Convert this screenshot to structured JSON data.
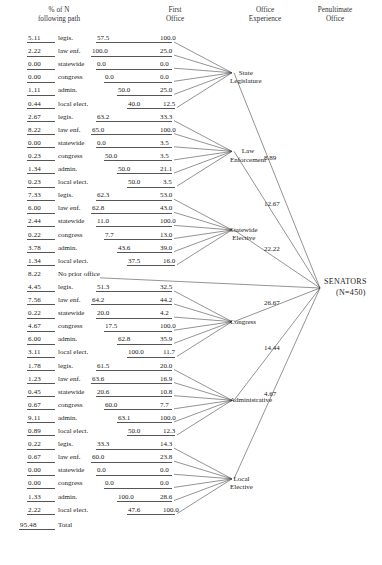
{
  "headers": [
    {
      "line1": "% of N",
      "line2": "following path"
    },
    {
      "line1": "First",
      "line2": "Office"
    },
    {
      "line1": "Office",
      "line2": "Experience"
    },
    {
      "line1": "Penultimate",
      "line2": "Office"
    }
  ],
  "terminal": {
    "name": "SENATORS",
    "n": "(N=450)"
  },
  "groups": [
    {
      "node": {
        "line1": "State",
        "line2": "Legislature"
      },
      "penultimate": "8.89",
      "rows": [
        {
          "pct": "5.11",
          "label": "legis.",
          "first": "57.5",
          "exp": "100.0"
        },
        {
          "pct": "2.22",
          "label": "law enf.",
          "first": "100.0",
          "exp": "25.0"
        },
        {
          "pct": "0.00",
          "label": "statewide",
          "first": "0.0",
          "exp": "0.0"
        },
        {
          "pct": "0.00",
          "label": "congress",
          "first": "0.0",
          "exp": "0.0"
        },
        {
          "pct": "1.11",
          "label": "admin.",
          "first": "50.0",
          "exp": "25.0"
        },
        {
          "pct": "0.44",
          "label": "local elect.",
          "first": "40.0",
          "exp": "12.5"
        }
      ]
    },
    {
      "node": {
        "line1": "Law",
        "line2": "Enforcement"
      },
      "penultimate": "12.67",
      "rows": [
        {
          "pct": "2.67",
          "label": "legis.",
          "first": "63.2",
          "exp": "33.3"
        },
        {
          "pct": "8.22",
          "label": "law enf.",
          "first": "65.0",
          "exp": "100.0"
        },
        {
          "pct": "0.00",
          "label": "statewide",
          "first": "0.0",
          "exp": "3.5"
        },
        {
          "pct": "0.23",
          "label": "congress",
          "first": "50.0",
          "exp": "3.5"
        },
        {
          "pct": "1.34",
          "label": "admin.",
          "first": "50.0",
          "exp": "21.1"
        },
        {
          "pct": "0.23",
          "label": "local elect.",
          "first": "50.0",
          "exp": "3.5"
        }
      ]
    },
    {
      "node": {
        "line1": "Statewide",
        "line2": "Elective"
      },
      "penultimate": "22.22",
      "rows": [
        {
          "pct": "7.33",
          "label": "legis.",
          "first": "62.3",
          "exp": "53.0"
        },
        {
          "pct": "6.00",
          "label": "law enf.",
          "first": "62.8",
          "exp": "43.0"
        },
        {
          "pct": "2.44",
          "label": "statewide",
          "first": "11.0",
          "exp": "100.0"
        },
        {
          "pct": "0.22",
          "label": "congress",
          "first": "7.7",
          "exp": "13.0"
        },
        {
          "pct": "3.78",
          "label": "admin.",
          "first": "43.6",
          "exp": "39.0"
        },
        {
          "pct": "1.34",
          "label": "local elect.",
          "first": "37.5",
          "exp": "16.0"
        }
      ]
    },
    {
      "node": {
        "line1": "Congress",
        "line2": ""
      },
      "penultimate": "26.67",
      "noprior": {
        "pct": "8.22",
        "label": "No prior office"
      },
      "rows": [
        {
          "pct": "4.45",
          "label": "legis.",
          "first": "51.3",
          "exp": "32.5"
        },
        {
          "pct": "7.56",
          "label": "law enf.",
          "first": "64.2",
          "exp": "44.2"
        },
        {
          "pct": "0.22",
          "label": "statewide",
          "first": "20.0",
          "exp": "4.2"
        },
        {
          "pct": "4.67",
          "label": "congress",
          "first": "17.5",
          "exp": "100.0"
        },
        {
          "pct": "6.00",
          "label": "admin.",
          "first": "62.8",
          "exp": "35.9"
        },
        {
          "pct": "3.11",
          "label": "local elect.",
          "first": "100.0",
          "exp": "11.7"
        }
      ]
    },
    {
      "node": {
        "line1": "Administrative",
        "line2": ""
      },
      "penultimate": "14.44",
      "rows": [
        {
          "pct": "1.78",
          "label": "legis.",
          "first": "61.5",
          "exp": "20.0"
        },
        {
          "pct": "1.23",
          "label": "law enf.",
          "first": "63.6",
          "exp": "16.9"
        },
        {
          "pct": "0.45",
          "label": "statewide",
          "first": "20.6",
          "exp": "10.8"
        },
        {
          "pct": "0.67",
          "label": "congress",
          "first": "60.0",
          "exp": "7.7"
        },
        {
          "pct": "9.11",
          "label": "admin.",
          "first": "63.1",
          "exp": "100.0"
        },
        {
          "pct": "0.89",
          "label": "local elect.",
          "first": "50.0",
          "exp": "12.3"
        }
      ]
    },
    {
      "node": {
        "line1": "Local",
        "line2": "Elective"
      },
      "penultimate": "4.67",
      "rows": [
        {
          "pct": "0.22",
          "label": "legis.",
          "first": "33.3",
          "exp": "14.3"
        },
        {
          "pct": "0.67",
          "label": "law enf.",
          "first": "60.0",
          "exp": "23.8"
        },
        {
          "pct": "0.00",
          "label": "statewide",
          "first": "0.0",
          "exp": "0.0"
        },
        {
          "pct": "0.00",
          "label": "congress",
          "first": "0.0",
          "exp": "0.0"
        },
        {
          "pct": "1.33",
          "label": "admin.",
          "first": "100.0",
          "exp": "28.6"
        },
        {
          "pct": "2.22",
          "label": "local elect.",
          "first": "47.6",
          "exp": "100.0"
        }
      ]
    }
  ],
  "total": {
    "pct": "95.48",
    "label": "Total"
  },
  "chart_data": {
    "type": "diagram",
    "columns": [
      "% of N following path",
      "First Office",
      "Office Experience",
      "Penultimate Office"
    ],
    "terminal_node": "SENATORS (N=450)",
    "penultimate_nodes": [
      {
        "name": "State Legislature",
        "value": 8.89
      },
      {
        "name": "Law Enforcement",
        "value": 12.67
      },
      {
        "name": "Statewide Elective",
        "value": 22.22
      },
      {
        "name": "Congress",
        "value": 26.67
      },
      {
        "name": "Administrative",
        "value": 14.44
      },
      {
        "name": "Local Elective",
        "value": 4.67
      }
    ],
    "no_prior_office": 8.22,
    "total": 95.48,
    "paths": [
      {
        "penultimate": "State Legislature",
        "first_office": "legis.",
        "pct_of_n": 5.11,
        "first": 57.5,
        "experience": 100.0
      },
      {
        "penultimate": "State Legislature",
        "first_office": "law enf.",
        "pct_of_n": 2.22,
        "first": 100.0,
        "experience": 25.0
      },
      {
        "penultimate": "State Legislature",
        "first_office": "statewide",
        "pct_of_n": 0.0,
        "first": 0.0,
        "experience": 0.0
      },
      {
        "penultimate": "State Legislature",
        "first_office": "congress",
        "pct_of_n": 0.0,
        "first": 0.0,
        "experience": 0.0
      },
      {
        "penultimate": "State Legislature",
        "first_office": "admin.",
        "pct_of_n": 1.11,
        "first": 50.0,
        "experience": 25.0
      },
      {
        "penultimate": "State Legislature",
        "first_office": "local elect.",
        "pct_of_n": 0.44,
        "first": 40.0,
        "experience": 12.5
      },
      {
        "penultimate": "Law Enforcement",
        "first_office": "legis.",
        "pct_of_n": 2.67,
        "first": 63.2,
        "experience": 33.3
      },
      {
        "penultimate": "Law Enforcement",
        "first_office": "law enf.",
        "pct_of_n": 8.22,
        "first": 65.0,
        "experience": 100.0
      },
      {
        "penultimate": "Law Enforcement",
        "first_office": "statewide",
        "pct_of_n": 0.0,
        "first": 0.0,
        "experience": 3.5
      },
      {
        "penultimate": "Law Enforcement",
        "first_office": "congress",
        "pct_of_n": 0.23,
        "first": 50.0,
        "experience": 3.5
      },
      {
        "penultimate": "Law Enforcement",
        "first_office": "admin.",
        "pct_of_n": 1.34,
        "first": 50.0,
        "experience": 21.1
      },
      {
        "penultimate": "Law Enforcement",
        "first_office": "local elect.",
        "pct_of_n": 0.23,
        "first": 50.0,
        "experience": 3.5
      },
      {
        "penultimate": "Statewide Elective",
        "first_office": "legis.",
        "pct_of_n": 7.33,
        "first": 62.3,
        "experience": 53.0
      },
      {
        "penultimate": "Statewide Elective",
        "first_office": "law enf.",
        "pct_of_n": 6.0,
        "first": 62.8,
        "experience": 43.0
      },
      {
        "penultimate": "Statewide Elective",
        "first_office": "statewide",
        "pct_of_n": 2.44,
        "first": 11.0,
        "experience": 100.0
      },
      {
        "penultimate": "Statewide Elective",
        "first_office": "congress",
        "pct_of_n": 0.22,
        "first": 7.7,
        "experience": 13.0
      },
      {
        "penultimate": "Statewide Elective",
        "first_office": "admin.",
        "pct_of_n": 3.78,
        "first": 43.6,
        "experience": 39.0
      },
      {
        "penultimate": "Statewide Elective",
        "first_office": "local elect.",
        "pct_of_n": 1.34,
        "first": 37.5,
        "experience": 16.0
      },
      {
        "penultimate": "Congress",
        "first_office": "legis.",
        "pct_of_n": 4.45,
        "first": 51.3,
        "experience": 32.5
      },
      {
        "penultimate": "Congress",
        "first_office": "law enf.",
        "pct_of_n": 7.56,
        "first": 64.2,
        "experience": 44.2
      },
      {
        "penultimate": "Congress",
        "first_office": "statewide",
        "pct_of_n": 0.22,
        "first": 20.0,
        "experience": 4.2
      },
      {
        "penultimate": "Congress",
        "first_office": "congress",
        "pct_of_n": 4.67,
        "first": 17.5,
        "experience": 100.0
      },
      {
        "penultimate": "Congress",
        "first_office": "admin.",
        "pct_of_n": 6.0,
        "first": 62.8,
        "experience": 35.9
      },
      {
        "penultimate": "Congress",
        "first_office": "local elect.",
        "pct_of_n": 3.11,
        "first": 100.0,
        "experience": 11.7
      },
      {
        "penultimate": "Administrative",
        "first_office": "legis.",
        "pct_of_n": 1.78,
        "first": 61.5,
        "experience": 20.0
      },
      {
        "penultimate": "Administrative",
        "first_office": "law enf.",
        "pct_of_n": 1.23,
        "first": 63.6,
        "experience": 16.9
      },
      {
        "penultimate": "Administrative",
        "first_office": "statewide",
        "pct_of_n": 0.45,
        "first": 20.6,
        "experience": 10.8
      },
      {
        "penultimate": "Administrative",
        "first_office": "congress",
        "pct_of_n": 0.67,
        "first": 60.0,
        "experience": 7.7
      },
      {
        "penultimate": "Administrative",
        "first_office": "admin.",
        "pct_of_n": 9.11,
        "first": 63.1,
        "experience": 100.0
      },
      {
        "penultimate": "Administrative",
        "first_office": "local elect.",
        "pct_of_n": 0.89,
        "first": 50.0,
        "experience": 12.3
      },
      {
        "penultimate": "Local Elective",
        "first_office": "legis.",
        "pct_of_n": 0.22,
        "first": 33.3,
        "experience": 14.3
      },
      {
        "penultimate": "Local Elective",
        "first_office": "law enf.",
        "pct_of_n": 0.67,
        "first": 60.0,
        "experience": 23.8
      },
      {
        "penultimate": "Local Elective",
        "first_office": "statewide",
        "pct_of_n": 0.0,
        "first": 0.0,
        "experience": 0.0
      },
      {
        "penultimate": "Local Elective",
        "first_office": "congress",
        "pct_of_n": 0.0,
        "first": 0.0,
        "experience": 0.0
      },
      {
        "penultimate": "Local Elective",
        "first_office": "admin.",
        "pct_of_n": 1.33,
        "first": 100.0,
        "experience": 28.6
      },
      {
        "penultimate": "Local Elective",
        "first_office": "local elect.",
        "pct_of_n": 2.22,
        "first": 47.6,
        "experience": 100.0
      }
    ]
  }
}
